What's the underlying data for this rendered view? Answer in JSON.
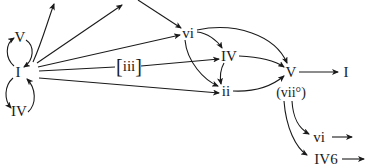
{
  "diagram": {
    "type": "harmonic-progression-flowchart",
    "nodes": {
      "V_left": {
        "label": "V",
        "x": 20,
        "y": 37
      },
      "I_left": {
        "label": "I",
        "x": 18,
        "y": 72
      },
      "IV_left": {
        "label": "IV",
        "x": 19,
        "y": 111
      },
      "vi": {
        "label": "vi",
        "x": 188,
        "y": 33
      },
      "iii": {
        "label": "iii",
        "bracket_open": "[",
        "bracket_close": "]",
        "x": 130,
        "y": 66
      },
      "IV_mid": {
        "label": "IV",
        "x": 228,
        "y": 55
      },
      "ii": {
        "label": "ii",
        "x": 226,
        "y": 91
      },
      "V_right": {
        "label": "V",
        "x": 290,
        "y": 72
      },
      "vii_dim": {
        "label": "(vii°)",
        "x": 291,
        "y": 92
      },
      "I_right": {
        "label": "I",
        "x": 346,
        "y": 72
      },
      "vi_lower": {
        "label": "vi",
        "x": 316,
        "y": 137
      },
      "IV6": {
        "label": "IV6",
        "x": 319,
        "y": 159
      }
    },
    "edges": [
      {
        "from": "I_left",
        "to": "V_left",
        "style": "curved"
      },
      {
        "from": "V_left",
        "to": "I_left",
        "style": "curved"
      },
      {
        "from": "I_left",
        "to": "IV_left",
        "style": "curved"
      },
      {
        "from": "IV_left",
        "to": "I_left",
        "style": "curved"
      },
      {
        "from": "I_left",
        "to": "offscreen-top-1",
        "style": "curved"
      },
      {
        "from": "I_left",
        "to": "offscreen-top-2",
        "style": "straight"
      },
      {
        "from": "offscreen-top-3",
        "to": "vi",
        "style": "straight"
      },
      {
        "from": "I_left",
        "to": "vi",
        "style": "straight"
      },
      {
        "from": "I_left",
        "to": "iii",
        "style": "straight"
      },
      {
        "from": "iii",
        "to": "IV_mid",
        "style": "straight"
      },
      {
        "from": "I_left",
        "to": "ii",
        "style": "straight"
      },
      {
        "from": "vi",
        "to": "IV_mid",
        "style": "curved"
      },
      {
        "from": "vi",
        "to": "ii",
        "style": "curved"
      },
      {
        "from": "vi",
        "to": "V_right",
        "style": "curved"
      },
      {
        "from": "IV_mid",
        "to": "ii",
        "style": "curved"
      },
      {
        "from": "IV_mid",
        "to": "V_right",
        "style": "curved"
      },
      {
        "from": "ii",
        "to": "V_right",
        "style": "curved"
      },
      {
        "from": "V_right",
        "to": "I_right",
        "style": "straight"
      },
      {
        "from": "vii_dim",
        "to": "vi_lower",
        "style": "curved"
      },
      {
        "from": "vii_dim",
        "to": "IV6",
        "style": "curved"
      },
      {
        "from": "vi_lower",
        "to": "offscreen-right-1",
        "style": "straight"
      },
      {
        "from": "IV6",
        "to": "offscreen-right-2",
        "style": "straight"
      }
    ],
    "colors": {
      "stroke": "#1a1a1a",
      "background": "#ffffff"
    }
  }
}
